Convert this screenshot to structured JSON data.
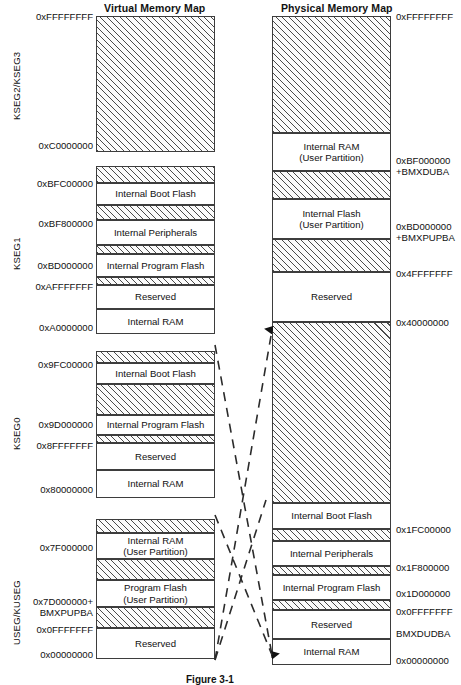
{
  "figure": {
    "caption": "Figure 3-1"
  },
  "columns": {
    "virtual": {
      "title": "Virtual Memory Map"
    },
    "physical": {
      "title": "Physical Memory Map"
    }
  },
  "segments": [
    {
      "name": "KSEG2/KSEG3"
    },
    {
      "name": "KSEG1"
    },
    {
      "name": "KSEG0"
    },
    {
      "name": "USEG/KUSEG"
    }
  ],
  "virtual_map": {
    "blocks": [
      {
        "label": "",
        "sub": "",
        "hatched": true,
        "top": 16,
        "height": 136
      },
      {
        "label": "",
        "sub": "",
        "hatched": true,
        "top": 166,
        "height": 17
      },
      {
        "label": "Internal Boot Flash",
        "sub": "",
        "hatched": false,
        "top": 183,
        "height": 22
      },
      {
        "label": "",
        "sub": "",
        "hatched": true,
        "top": 205,
        "height": 15
      },
      {
        "label": "Internal Peripherals",
        "sub": "",
        "hatched": false,
        "top": 220,
        "height": 25
      },
      {
        "label": "",
        "sub": "",
        "hatched": true,
        "top": 245,
        "height": 9
      },
      {
        "label": "Internal Program Flash",
        "sub": "",
        "hatched": false,
        "top": 254,
        "height": 23
      },
      {
        "label": "",
        "sub": "",
        "hatched": true,
        "top": 277,
        "height": 8
      },
      {
        "label": "Reserved",
        "sub": "",
        "hatched": false,
        "top": 285,
        "height": 24
      },
      {
        "label": "Internal RAM",
        "sub": "",
        "hatched": false,
        "top": 309,
        "height": 25
      },
      {
        "label": "",
        "sub": "",
        "hatched": true,
        "top": 351,
        "height": 12
      },
      {
        "label": "Internal Boot Flash",
        "sub": "",
        "hatched": false,
        "top": 363,
        "height": 21
      },
      {
        "label": "",
        "sub": "",
        "hatched": true,
        "top": 384,
        "height": 31
      },
      {
        "label": "Internal Program Flash",
        "sub": "",
        "hatched": false,
        "top": 415,
        "height": 20
      },
      {
        "label": "",
        "sub": "",
        "hatched": true,
        "top": 435,
        "height": 8
      },
      {
        "label": "Reserved",
        "sub": "",
        "hatched": false,
        "top": 443,
        "height": 27
      },
      {
        "label": "Internal RAM",
        "sub": "",
        "hatched": false,
        "top": 470,
        "height": 28
      },
      {
        "label": "",
        "sub": "",
        "hatched": true,
        "top": 519,
        "height": 14
      },
      {
        "label": "Internal RAM",
        "sub": "(User Partition)",
        "hatched": false,
        "top": 533,
        "height": 26
      },
      {
        "label": "",
        "sub": "",
        "hatched": true,
        "top": 559,
        "height": 21
      },
      {
        "label": "Program Flash",
        "sub": "(User Partition)",
        "hatched": false,
        "top": 580,
        "height": 27
      },
      {
        "label": "",
        "sub": "",
        "hatched": true,
        "top": 607,
        "height": 21
      },
      {
        "label": "Reserved",
        "sub": "",
        "hatched": false,
        "top": 628,
        "height": 31
      }
    ],
    "addresses": [
      {
        "text": "0xFFFFFFFF",
        "top": 11
      },
      {
        "text": "0xC0000000",
        "top": 140
      },
      {
        "text": "0xBFC00000",
        "top": 178
      },
      {
        "text": "0xBF800000",
        "top": 218
      },
      {
        "text": "0xBD000000",
        "top": 260
      },
      {
        "text": "0xAFFFFFFF",
        "top": 281
      },
      {
        "text": "0xA0000000",
        "top": 322
      },
      {
        "text": "0x9FC00000",
        "top": 359
      },
      {
        "text": "0x9D000000",
        "top": 419
      },
      {
        "text": "0x8FFFFFFF",
        "top": 440
      },
      {
        "text": "0x80000000",
        "top": 484
      },
      {
        "text": "0x7F000000",
        "top": 542
      },
      {
        "text": "0x7D000000+",
        "top": 596
      },
      {
        "text": "BMXPUPBA",
        "top": 607
      },
      {
        "text": "0x0FFFFFFF",
        "top": 624
      },
      {
        "text": "0x00000000",
        "top": 649
      }
    ]
  },
  "physical_map": {
    "blocks": [
      {
        "label": "",
        "sub": "",
        "hatched": true,
        "top": 16,
        "height": 117
      },
      {
        "label": "Internal RAM",
        "sub": "(User Partition)",
        "hatched": false,
        "top": 133,
        "height": 38
      },
      {
        "label": "",
        "sub": "",
        "hatched": true,
        "top": 171,
        "height": 28
      },
      {
        "label": "Internal Flash",
        "sub": "(User Partition)",
        "hatched": false,
        "top": 199,
        "height": 40
      },
      {
        "label": "",
        "sub": "",
        "hatched": true,
        "top": 239,
        "height": 33
      },
      {
        "label": "Reserved",
        "sub": "",
        "hatched": false,
        "top": 272,
        "height": 50
      },
      {
        "label": "",
        "sub": "",
        "hatched": true,
        "top": 322,
        "height": 181
      },
      {
        "label": "Internal Boot Flash",
        "sub": "",
        "hatched": false,
        "top": 503,
        "height": 26
      },
      {
        "label": "",
        "sub": "",
        "hatched": true,
        "top": 529,
        "height": 12
      },
      {
        "label": "Internal Peripherals",
        "sub": "",
        "hatched": false,
        "top": 541,
        "height": 25
      },
      {
        "label": "",
        "sub": "",
        "hatched": true,
        "top": 566,
        "height": 9
      },
      {
        "label": "Internal Program Flash",
        "sub": "",
        "hatched": false,
        "top": 575,
        "height": 25
      },
      {
        "label": "",
        "sub": "",
        "hatched": true,
        "top": 600,
        "height": 10
      },
      {
        "label": "Reserved",
        "sub": "",
        "hatched": false,
        "top": 610,
        "height": 29
      },
      {
        "label": "Internal RAM",
        "sub": "",
        "hatched": false,
        "top": 639,
        "height": 26
      }
    ],
    "addresses": [
      {
        "text": "0xFFFFFFFF",
        "top": 11
      },
      {
        "text": "0xBF000000",
        "top": 155
      },
      {
        "text": "+BMXDUBA",
        "top": 166
      },
      {
        "text": "0xBD000000",
        "top": 221
      },
      {
        "text": "+BMXPUPBA",
        "top": 232
      },
      {
        "text": "0x4FFFFFFF",
        "top": 268
      },
      {
        "text": "0x40000000",
        "top": 317
      },
      {
        "text": "0x1FC00000",
        "top": 524
      },
      {
        "text": "0x1F800000",
        "top": 562
      },
      {
        "text": "0x1D000000",
        "top": 588
      },
      {
        "text": "0x0FFFFFFF",
        "top": 606
      },
      {
        "text": "BMXDUDBA",
        "top": 628
      },
      {
        "text": "0x00000000",
        "top": 655
      }
    ]
  },
  "connectors": {
    "description": "dashed mapping lines between virtual and physical memory maps",
    "arrows": [
      "up-arrow-physical-upper",
      "down-arrow-physical-lower"
    ]
  }
}
